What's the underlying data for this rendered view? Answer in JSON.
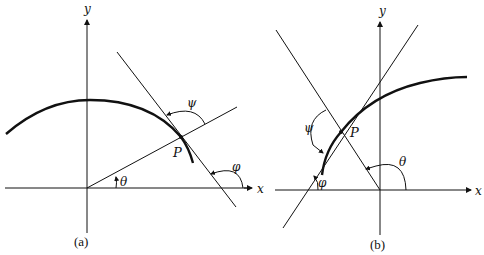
{
  "figure": {
    "panels": [
      {
        "id": "a",
        "caption": "(a)",
        "axes": {
          "x_label": "x",
          "y_label": "y"
        },
        "point_label": "P",
        "angles": {
          "theta": "θ",
          "psi": "ψ",
          "phi": "φ"
        }
      },
      {
        "id": "b",
        "caption": "(b)",
        "axes": {
          "x_label": "x",
          "y_label": "y"
        },
        "point_label": "P",
        "angles": {
          "theta": "θ",
          "psi": "ψ",
          "phi": "φ"
        }
      }
    ]
  },
  "colors": {
    "ink": "#111111",
    "background": "#ffffff"
  }
}
